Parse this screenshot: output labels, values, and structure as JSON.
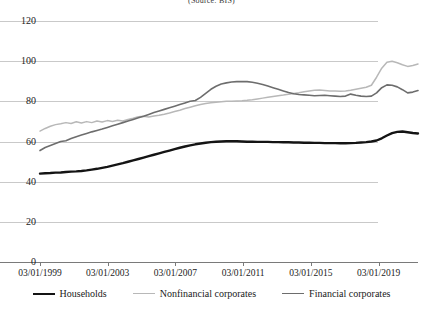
{
  "title_partial": "(Source: BIS)",
  "legend": {
    "items": [
      {
        "label": "Households",
        "color": "#141414",
        "key": "households"
      },
      {
        "label": "Nonfinancial corporates",
        "color": "#b8b8b8",
        "key": "nonfinancial"
      },
      {
        "label": "Financial corporates",
        "color": "#6d6d6d",
        "key": "financial"
      }
    ]
  },
  "chart_data": {
    "type": "line",
    "title": "(Source: BIS)",
    "xlabel": "",
    "ylabel": "",
    "ylim": [
      0,
      120
    ],
    "ytick_labels": [
      "0",
      "20",
      "40",
      "60",
      "80",
      "100",
      "120"
    ],
    "ytick_values": [
      0,
      20,
      40,
      60,
      80,
      100,
      120
    ],
    "grid": true,
    "legend_position": "bottom",
    "xtick_labels": [
      "03/01/1999",
      "03/01/2003",
      "03/01/2007",
      "03/01/2011",
      "03/01/2015",
      "03/01/2019"
    ],
    "xtick_values": [
      1999.17,
      2003.17,
      2007.17,
      2011.17,
      2015.17,
      2019.17
    ],
    "xlim": [
      1999.17,
      2021.5
    ],
    "series": [
      {
        "name": "Households",
        "color": "#141414",
        "width": 2.4,
        "values": [
          44.0,
          44.2,
          44.3,
          44.5,
          44.6,
          44.8,
          45.0,
          45.1,
          45.3,
          45.6,
          46.0,
          46.4,
          46.9,
          47.4,
          48.0,
          48.6,
          49.2,
          49.9,
          50.6,
          51.3,
          52.0,
          52.7,
          53.4,
          54.1,
          54.8,
          55.5,
          56.2,
          56.9,
          57.5,
          58.1,
          58.6,
          59.0,
          59.4,
          59.7,
          59.9,
          60.0,
          60.1,
          60.2,
          60.1,
          60.0,
          59.9,
          59.9,
          59.8,
          59.8,
          59.8,
          59.7,
          59.7,
          59.6,
          59.6,
          59.5,
          59.5,
          59.4,
          59.4,
          59.3,
          59.3,
          59.2,
          59.2,
          59.2,
          59.1,
          59.1,
          59.2,
          59.3,
          59.5,
          59.7,
          60.0,
          60.5,
          61.6,
          63.0,
          64.2,
          64.8,
          65.0,
          64.6,
          64.2,
          64.0
        ]
      },
      {
        "name": "Nonfinancial corporates",
        "color": "#b8b8b8",
        "width": 1.5,
        "values": [
          65.2,
          66.5,
          67.6,
          68.4,
          68.8,
          69.4,
          69.0,
          69.8,
          69.2,
          69.9,
          69.4,
          70.2,
          69.7,
          70.4,
          70.0,
          70.6,
          70.2,
          71.0,
          71.6,
          72.3,
          72.6,
          72.2,
          72.7,
          73.1,
          73.6,
          74.2,
          74.9,
          75.6,
          76.4,
          77.1,
          77.8,
          78.4,
          78.9,
          79.3,
          79.6,
          79.8,
          80.0,
          80.1,
          80.2,
          80.3,
          80.5,
          80.8,
          81.2,
          81.6,
          82.0,
          82.4,
          82.8,
          83.1,
          83.5,
          83.9,
          84.3,
          84.8,
          85.2,
          85.5,
          85.6,
          85.4,
          85.2,
          85.1,
          85.0,
          85.2,
          85.5,
          86.0,
          86.5,
          87.0,
          88.0,
          92.0,
          96.5,
          99.5,
          100.0,
          99.2,
          98.2,
          97.4,
          97.8,
          98.6
        ]
      },
      {
        "name": "Financial corporates",
        "color": "#6d6d6d",
        "width": 1.6,
        "values": [
          55.5,
          57.0,
          58.0,
          59.0,
          60.0,
          60.4,
          61.5,
          62.4,
          63.2,
          64.0,
          64.8,
          65.5,
          66.2,
          67.0,
          67.8,
          68.6,
          69.4,
          70.2,
          71.0,
          71.8,
          72.6,
          73.5,
          74.4,
          75.2,
          76.0,
          76.8,
          77.6,
          78.4,
          79.2,
          80.0,
          80.4,
          82.0,
          84.0,
          86.0,
          87.5,
          88.6,
          89.2,
          89.6,
          89.8,
          89.9,
          89.8,
          89.5,
          89.0,
          88.4,
          87.6,
          86.8,
          86.0,
          85.2,
          84.4,
          83.8,
          83.4,
          83.2,
          83.0,
          82.8,
          82.9,
          83.0,
          82.8,
          82.6,
          82.4,
          82.6,
          83.6,
          83.0,
          82.6,
          82.4,
          82.6,
          84.2,
          86.8,
          88.2,
          88.0,
          87.2,
          85.8,
          84.2,
          84.6,
          85.4
        ]
      }
    ]
  }
}
